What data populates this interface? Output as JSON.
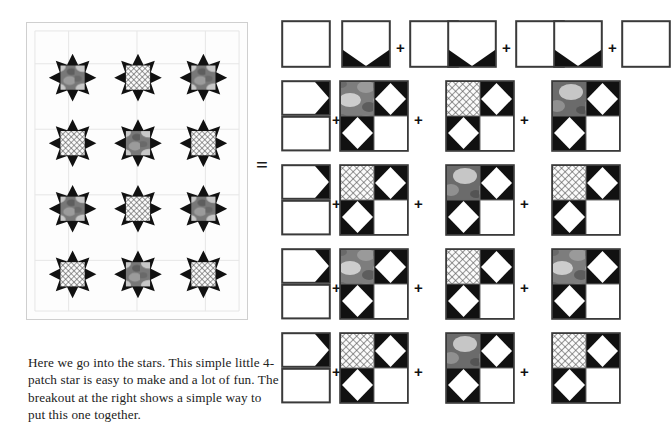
{
  "document": {
    "title": "4-Patch Star Quilt Pattern Breakout",
    "caption": "Here we go into the stars.  This simple little 4-patch star is easy to make and a lot of fun.  The breakout at the right shows a simple way to put this one together.",
    "equals_symbol": "=",
    "plus_symbol": "+"
  },
  "colors": {
    "background": "#ffffff",
    "star_point_dark": "#111111",
    "fabric_white": "#ffffff",
    "fabric_offwhite": "#f7f7f7",
    "print_grey_base": "#787878",
    "print_grey_blob": "#c8c8c8",
    "print_grey_dark": "#5a5a5a",
    "crosshatch_line": "#4a4a4a",
    "crosshatch_base": "#fafafa",
    "grid_line": "#e2e2e2",
    "panel_border": "#cfcfcf",
    "outline": "#3a3a3a",
    "text": "#222222"
  },
  "quilt": {
    "name": "quilt-layout-preview",
    "rows": 4,
    "columns": 3,
    "block_label": "4-patch star block",
    "centers": [
      [
        "print",
        "hatch",
        "print"
      ],
      [
        "hatch",
        "print",
        "hatch"
      ],
      [
        "print",
        "hatch",
        "print"
      ],
      [
        "hatch",
        "print",
        "hatch"
      ]
    ],
    "grid_visible": true,
    "border_visible": true
  },
  "breakout": {
    "name": "block-construction-breakout",
    "row_count": 5,
    "rows": [
      {
        "index": 1,
        "type": "top-units",
        "units": [
          {
            "kind": "plain-square",
            "label": "plain square"
          },
          {
            "kind": "flying-geese",
            "label": "flying geese unit"
          },
          {
            "kind": "plain-square",
            "label": "plain square"
          },
          {
            "kind": "flying-geese",
            "label": "flying geese unit"
          },
          {
            "kind": "plain-square",
            "label": "plain square"
          },
          {
            "kind": "flying-geese",
            "label": "flying geese unit"
          },
          {
            "kind": "plain-square",
            "label": "plain square"
          }
        ],
        "operators": [
          "",
          "",
          "+",
          "",
          "+",
          "",
          "+"
        ]
      },
      {
        "index": 2,
        "type": "quarter-blocks",
        "units": [
          {
            "kind": "half-unit",
            "label": "half block unit"
          },
          {
            "kind": "quarter-block",
            "center": "print",
            "label": "quarter block print center"
          },
          {
            "kind": "quarter-block",
            "center": "hatch",
            "label": "quarter block hatch center"
          },
          {
            "kind": "quarter-block",
            "center": "print",
            "label": "quarter block print center"
          }
        ],
        "operators": [
          "",
          "+",
          "+",
          "+"
        ]
      },
      {
        "index": 3,
        "type": "quarter-blocks",
        "units": [
          {
            "kind": "half-unit",
            "label": "half block unit"
          },
          {
            "kind": "quarter-block",
            "center": "hatch",
            "label": "quarter block hatch center"
          },
          {
            "kind": "quarter-block",
            "center": "print",
            "label": "quarter block print center"
          },
          {
            "kind": "quarter-block",
            "center": "hatch",
            "label": "quarter block hatch center"
          }
        ],
        "operators": [
          "",
          "+",
          "+",
          "+"
        ]
      },
      {
        "index": 4,
        "type": "quarter-blocks",
        "units": [
          {
            "kind": "half-unit",
            "label": "half block unit"
          },
          {
            "kind": "quarter-block",
            "center": "print",
            "label": "quarter block print center"
          },
          {
            "kind": "quarter-block",
            "center": "hatch",
            "label": "quarter block hatch center"
          },
          {
            "kind": "quarter-block",
            "center": "print",
            "label": "quarter block print center"
          }
        ],
        "operators": [
          "",
          "+",
          "+",
          "+"
        ]
      },
      {
        "index": 5,
        "type": "quarter-blocks-clipped",
        "units": [
          {
            "kind": "half-unit",
            "label": "half block unit"
          },
          {
            "kind": "quarter-block",
            "center": "hatch",
            "label": "quarter block hatch center"
          },
          {
            "kind": "quarter-block",
            "center": "print",
            "label": "quarter block print center"
          },
          {
            "kind": "quarter-block",
            "center": "hatch",
            "label": "quarter block hatch center"
          }
        ],
        "operators": [
          "",
          "+",
          "+",
          "+"
        ]
      }
    ]
  }
}
